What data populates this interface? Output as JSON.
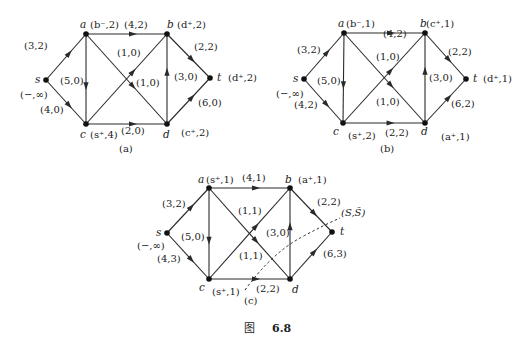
{
  "figure_caption": {
    "prefix": "图",
    "number": "6.8"
  },
  "diagrams": [
    {
      "id": "a",
      "caption": "(a)",
      "caption_pos": [
        127,
        152
      ],
      "nodes": {
        "s": {
          "x": 46,
          "y": 80,
          "name": "s",
          "label": "(−,∞)",
          "name_dx": -11,
          "name_dy": 3,
          "label_dx": -26,
          "label_dy": 18
        },
        "a": {
          "x": 86,
          "y": 34,
          "name": "a",
          "label": "(b⁻,2)",
          "name_dx": -6,
          "name_dy": -6,
          "label_dx": 4,
          "label_dy": -6
        },
        "b": {
          "x": 167,
          "y": 34,
          "name": "b",
          "label": "(d⁺,2)",
          "name_dx": 0,
          "name_dy": -6,
          "label_dx": 10,
          "label_dy": -6
        },
        "c": {
          "x": 86,
          "y": 124,
          "name": "c",
          "label": "(s⁺,4)",
          "name_dx": -6,
          "name_dy": 14,
          "label_dx": 4,
          "label_dy": 14
        },
        "d": {
          "x": 167,
          "y": 124,
          "name": "d",
          "label": "(c⁺,2)",
          "name_dx": -4,
          "name_dy": 14,
          "label_dx": 14,
          "label_dy": 12
        },
        "t": {
          "x": 210,
          "y": 78,
          "name": "t",
          "label": "(d⁺,2)",
          "name_dx": 7,
          "name_dy": 3,
          "label_dx": 18,
          "label_dy": 3
        }
      },
      "edges": [
        {
          "from": "s",
          "to": "a",
          "label": "(3,2)",
          "lx": 24,
          "ly": 49
        },
        {
          "from": "s",
          "to": "c",
          "label": "(4,0)",
          "lx": 40,
          "ly": 113
        },
        {
          "from": "a",
          "to": "b",
          "label": "(4,2)",
          "lx": 124,
          "ly": 28
        },
        {
          "from": "a",
          "to": "c",
          "label": "(5,0)",
          "lx": 60,
          "ly": 84
        },
        {
          "from": "a",
          "to": "d",
          "label": "(1,0)",
          "lx": 136,
          "ly": 86
        },
        {
          "from": "c",
          "to": "b",
          "label": "(1,0)",
          "lx": 117,
          "ly": 56
        },
        {
          "from": "c",
          "to": "d",
          "label": "(2,0)",
          "lx": 121,
          "ly": 134
        },
        {
          "from": "d",
          "to": "b",
          "label": "(3,0)",
          "lx": 174,
          "ly": 80
        },
        {
          "from": "b",
          "to": "t",
          "label": "(2,2)",
          "lx": 194,
          "ly": 50
        },
        {
          "from": "d",
          "to": "t",
          "label": "(6,0)",
          "lx": 198,
          "ly": 106
        }
      ]
    },
    {
      "id": "b",
      "caption": "(b)",
      "caption_pos": [
        388,
        152
      ],
      "nodes": {
        "s": {
          "x": 304,
          "y": 79,
          "name": "s",
          "label": "(−,∞)",
          "name_dx": -11,
          "name_dy": 3,
          "label_dx": -28,
          "label_dy": 18
        },
        "a": {
          "x": 344,
          "y": 33,
          "name": "a",
          "label": "(b⁻,1)",
          "name_dx": -6,
          "name_dy": -6,
          "label_dx": 2,
          "label_dy": -6
        },
        "b": {
          "x": 425,
          "y": 33,
          "name": "b",
          "label": "(c⁺,1)",
          "name_dx": -5,
          "name_dy": -6,
          "label_dx": 1,
          "label_dy": -6
        },
        "c": {
          "x": 343,
          "y": 123,
          "name": "c",
          "label": "(s⁺,2)",
          "name_dx": -10,
          "name_dy": 12,
          "label_dx": 5,
          "label_dy": 16
        },
        "d": {
          "x": 425,
          "y": 123,
          "name": "d",
          "label": "(a⁺,1)",
          "name_dx": -4,
          "name_dy": 12,
          "label_dx": 16,
          "label_dy": 17
        },
        "t": {
          "x": 466,
          "y": 79,
          "name": "t",
          "label": "(d⁺,1)",
          "name_dx": 7,
          "name_dy": 3,
          "label_dx": 17,
          "label_dy": 3
        }
      },
      "edges": [
        {
          "from": "s",
          "to": "a",
          "label": "(3,2)",
          "lx": 297,
          "ly": 53
        },
        {
          "from": "s",
          "to": "c",
          "label": "(4,2)",
          "lx": 294,
          "ly": 108
        },
        {
          "from": "a",
          "to": "b",
          "label": "(4,2)",
          "lx": 383,
          "ly": 37
        },
        {
          "from": "a",
          "to": "c",
          "label": "(5,0)",
          "lx": 317,
          "ly": 84
        },
        {
          "from": "a",
          "to": "d",
          "label": "(1,0)",
          "lx": 376,
          "ly": 105
        },
        {
          "from": "c",
          "to": "b",
          "label": "(1,0)",
          "lx": 376,
          "ly": 60
        },
        {
          "from": "c",
          "to": "d",
          "label": "(2,2)",
          "lx": 385,
          "ly": 136
        },
        {
          "from": "d",
          "to": "b",
          "label": "(3,0)",
          "lx": 429,
          "ly": 81
        },
        {
          "from": "b",
          "to": "t",
          "label": "(2,2)",
          "lx": 448,
          "ly": 55
        },
        {
          "from": "d",
          "to": "t",
          "label": "(6,2)",
          "lx": 451,
          "ly": 107
        }
      ]
    },
    {
      "id": "c",
      "caption": "(c)",
      "caption_pos": [
        252,
        304
      ],
      "nodes": {
        "s": {
          "x": 167,
          "y": 233,
          "name": "s",
          "label": "(−,∞)",
          "name_dx": -11,
          "name_dy": 3,
          "label_dx": -30,
          "label_dy": 16
        },
        "a": {
          "x": 209,
          "y": 188,
          "name": "a",
          "label": "(s⁺,1)",
          "name_dx": -11,
          "name_dy": -5,
          "label_dx": -3,
          "label_dy": -5
        },
        "b": {
          "x": 290,
          "y": 188,
          "name": "b",
          "label": "(a⁺,1)",
          "name_dx": -5,
          "name_dy": -5,
          "label_dx": 8,
          "label_dy": -5
        },
        "c": {
          "x": 209,
          "y": 279,
          "name": "c",
          "label": "(s⁺,1)",
          "name_dx": -10,
          "name_dy": 12,
          "label_dx": 3,
          "label_dy": 16
        },
        "d": {
          "x": 290,
          "y": 279,
          "name": "d",
          "label": "",
          "name_dx": 2,
          "name_dy": 14,
          "label_dx": 0,
          "label_dy": 0
        },
        "t": {
          "x": 332,
          "y": 232,
          "name": "t",
          "label": "",
          "name_dx": 8,
          "name_dy": 3,
          "label_dx": 0,
          "label_dy": 0
        }
      },
      "edges": [
        {
          "from": "s",
          "to": "a",
          "label": "(3,2)",
          "lx": 162,
          "ly": 207
        },
        {
          "from": "s",
          "to": "c",
          "label": "(4,3)",
          "lx": 157,
          "ly": 262
        },
        {
          "from": "a",
          "to": "b",
          "label": "(4,1)",
          "lx": 242,
          "ly": 181
        },
        {
          "from": "a",
          "to": "c",
          "label": "(5,0)",
          "lx": 181,
          "ly": 240
        },
        {
          "from": "a",
          "to": "d",
          "label": "(1,1)",
          "lx": 239,
          "ly": 259
        },
        {
          "from": "c",
          "to": "b",
          "label": "(1,1)",
          "lx": 238,
          "ly": 214
        },
        {
          "from": "c",
          "to": "d",
          "label": "(2,2)",
          "lx": 256,
          "ly": 292
        },
        {
          "from": "d",
          "to": "b",
          "label": "(3,0)",
          "lx": 266,
          "ly": 236
        },
        {
          "from": "b",
          "to": "t",
          "label": "(2,2)",
          "lx": 317,
          "ly": 205
        },
        {
          "from": "d",
          "to": "t",
          "label": "(6,3)",
          "lx": 323,
          "ly": 257
        }
      ],
      "cut": {
        "label": "(S,S̄)",
        "label_pos": [
          341,
          216
        ],
        "path": "M245,290 Q 270,255 300,238 Q 322,226 340,218"
      }
    }
  ]
}
